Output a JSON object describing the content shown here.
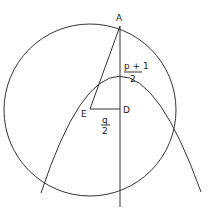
{
  "diagram": {
    "points": {
      "A": {
        "label": "A",
        "x": 120,
        "y": 26
      },
      "D": {
        "label": "D",
        "x": 120,
        "y": 109
      },
      "E": {
        "label": "E",
        "x": 90,
        "y": 109
      }
    },
    "labels": {
      "AD_numerator": "p + 1",
      "AD_denominator": "2",
      "ED_numerator": "q",
      "ED_denominator": "2"
    },
    "colors": {
      "line": "#333333",
      "background": "#ffffff"
    }
  }
}
